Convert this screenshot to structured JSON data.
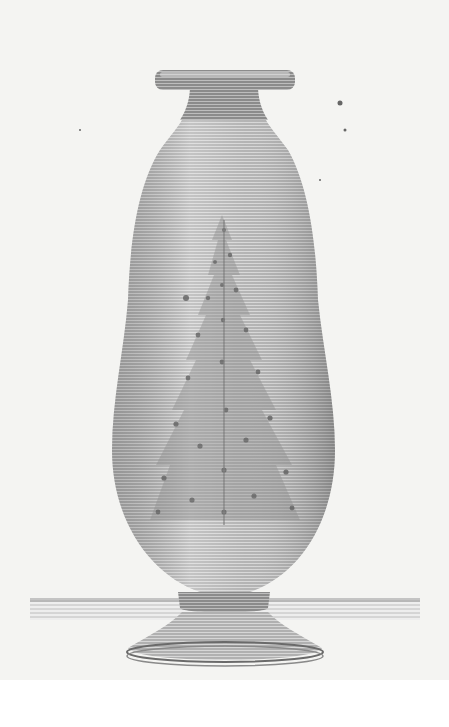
{
  "illustration": {
    "subject": "vase",
    "style": "engraving",
    "decoration": "tree-motif",
    "colors": {
      "paper": "#f4f4f2",
      "ink": "#7a7a7a",
      "ink_dark": "#5e5e5e",
      "highlight": "#d8d8d8",
      "background": "#ffffff"
    }
  }
}
